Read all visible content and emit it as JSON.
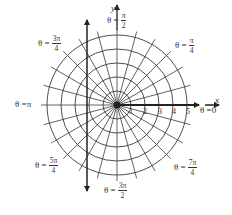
{
  "diagram": {
    "center": {
      "x": 117,
      "y": 105
    },
    "ring_spacing_px": 14,
    "rings": [
      1,
      2,
      3,
      4,
      5
    ],
    "radial_step_degrees": 15,
    "radial_count": 24,
    "radial_extent_px": 76,
    "colors": {
      "grid": "#3a3a3a",
      "axis": "#222222",
      "background": "#ffffff",
      "text": "#333333"
    }
  },
  "axes": {
    "x_label": "x",
    "y_label": "y"
  },
  "ticks": [
    {
      "label": "1",
      "value": 1
    },
    {
      "label": "2",
      "value": 2
    },
    {
      "label": "3",
      "value": 3
    },
    {
      "label": "4",
      "value": 4
    },
    {
      "label": "5",
      "value": 5
    }
  ],
  "angle_labels": {
    "theta_0": {
      "prefix": "θ = ",
      "value": "0"
    },
    "theta_pi_over_4": {
      "prefix": "θ = ",
      "num": "π",
      "den": "4"
    },
    "theta_pi_over_2": {
      "prefix": "θ = ",
      "num": "π",
      "den": "2"
    },
    "theta_3pi_over_4": {
      "prefix": "θ = ",
      "num": "3π",
      "den": "4"
    },
    "theta_pi": {
      "prefix": "θ = ",
      "value": "π"
    },
    "theta_5pi_over_4": {
      "prefix": "θ = ",
      "num": "5π",
      "den": "4"
    },
    "theta_3pi_over_2": {
      "prefix": "θ = ",
      "num": "3π",
      "den": "2"
    },
    "theta_7pi_over_4": {
      "prefix": "θ = ",
      "num": "7π",
      "den": "4"
    }
  }
}
